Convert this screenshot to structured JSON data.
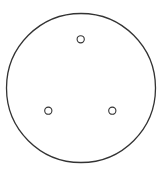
{
  "diagram": {
    "background": "#ffffff",
    "stroke_color": "#333333",
    "outer_circle": {
      "cx": 81,
      "cy": 88,
      "r": 74.5,
      "stroke_width": 1.3
    },
    "holes": [
      {
        "cx": 80.7,
        "cy": 39.3,
        "r": 3.6
      },
      {
        "cx": 48.3,
        "cy": 110.7,
        "r": 3.6
      },
      {
        "cx": 112.3,
        "cy": 110.7,
        "r": 3.6
      }
    ]
  }
}
